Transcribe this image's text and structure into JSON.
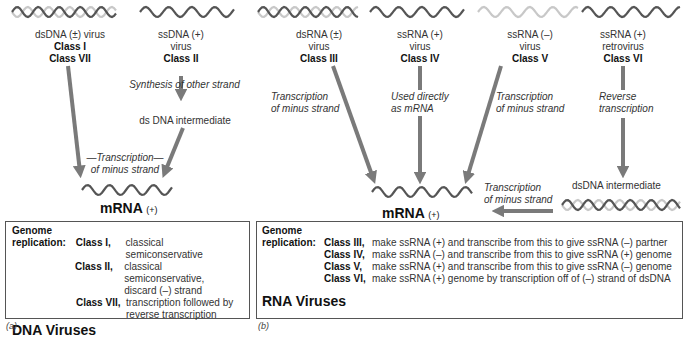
{
  "panel_a": {
    "viruses": [
      {
        "type": "dsDNA (±) virus",
        "classes": [
          "Class I",
          "Class VII"
        ]
      },
      {
        "type_line1": "ssDNA (+)",
        "type_line2": "virus",
        "classes": [
          "Class II"
        ]
      }
    ],
    "synthesis_label": "Synthesis of other strand",
    "intermediate_label": "ds DNA intermediate",
    "transcription_label_line1": "—Transcription—",
    "transcription_label_line2": "of minus strand",
    "mrna_label": "mRNA",
    "mrna_sign": "(+)",
    "box": {
      "genome": "Genome",
      "replication": "replication:",
      "rows": [
        {
          "cls": "Class I",
          "text": "classical semiconservative"
        },
        {
          "cls": "Class II",
          "text": "classical semiconservative,",
          "text2": "discard (–) strand"
        },
        {
          "cls": "Class VII",
          "text": "transcription followed by",
          "text2": "reverse transcription"
        }
      ],
      "title": "DNA Viruses"
    },
    "caption": "(a)"
  },
  "panel_b": {
    "viruses": [
      {
        "line1": "dsRNA (±)",
        "line2": "virus",
        "cls": "Class III"
      },
      {
        "line1": "ssRNA (+)",
        "line2": "virus",
        "cls": "Class IV"
      },
      {
        "line1": "ssRNA (–)",
        "line2": "virus",
        "cls": "Class V"
      },
      {
        "line1": "ssRNA (+)",
        "line2": "retrovirus",
        "cls": "Class VI"
      }
    ],
    "labels": {
      "class3_l1": "Transcription",
      "class3_l2": "of minus strand",
      "class4_l1": "Used directly",
      "class4_l2": "as mRNA",
      "class5_l1": "Transcription",
      "class5_l2": "of minus strand",
      "class6_l1": "Reverse",
      "class6_l2": "transcription",
      "dsdna_intermediate": "dsDNA intermediate",
      "bottom_l1": "Transcription",
      "bottom_l2": "of minus strand"
    },
    "mrna_label": "mRNA",
    "mrna_sign": "(+)",
    "box": {
      "genome": "Genome",
      "replication": "replication:",
      "rows": [
        {
          "cls": "Class III",
          "text": "make ssRNA (+) and transcribe from this to give ssRNA (–) partner"
        },
        {
          "cls": "Class IV",
          "text": "make ssRNA (–) and transcribe from this to give ssRNA (+) genome"
        },
        {
          "cls": "Class V",
          "text": "make ssRNA (+) and transcribe from this to give ssRNA (–) genome"
        },
        {
          "cls": "Class VI",
          "text": "make ssRNA (+) genome by transcription off of (–) strand of dsDNA"
        }
      ],
      "title": "RNA Viruses"
    },
    "caption": "(b)"
  },
  "colors": {
    "arrow": "#7a7a7a",
    "strand_dark": "#555555",
    "strand_light": "#c8c8c8"
  }
}
